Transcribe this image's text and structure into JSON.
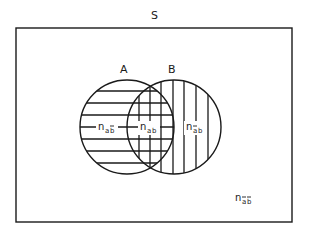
{
  "diagram": {
    "universe": {
      "label": "S",
      "rect": {
        "x": 16,
        "y": 28,
        "width": 276,
        "height": 194
      }
    },
    "sets": [
      {
        "id": "A",
        "label": "A",
        "cx": 127,
        "cy": 127,
        "r": 47,
        "hatch": "horizontal"
      },
      {
        "id": "B",
        "label": "B",
        "cx": 174,
        "cy": 127,
        "r": 47,
        "hatch": "vertical"
      }
    ],
    "hatching": {
      "horizontal_y": [
        91,
        103,
        115,
        127,
        139,
        151,
        163
      ],
      "vertical_x": [
        139,
        150,
        161,
        173,
        184,
        196,
        208
      ]
    },
    "regions": [
      {
        "id": "A_not_B",
        "base": "n",
        "sub": "ab",
        "sub_bars": [
          false,
          true
        ],
        "text": "n_ab̄",
        "x": 98,
        "y": 130
      },
      {
        "id": "A_and_B",
        "base": "n",
        "sub": "ab",
        "sub_bars": [
          false,
          false
        ],
        "text": "n_ab",
        "x": 140,
        "y": 130
      },
      {
        "id": "B_not_A",
        "base": "n",
        "sub": "ab",
        "sub_bars": [
          true,
          false
        ],
        "text": "n_āb",
        "x": 186,
        "y": 130
      },
      {
        "id": "neither",
        "base": "n",
        "sub": "ab",
        "sub_bars": [
          true,
          true
        ],
        "text": "n_āb̄",
        "x": 235,
        "y": 201
      }
    ],
    "colors": {
      "stroke": "#1a1a1a",
      "background": "#ffffff"
    }
  }
}
